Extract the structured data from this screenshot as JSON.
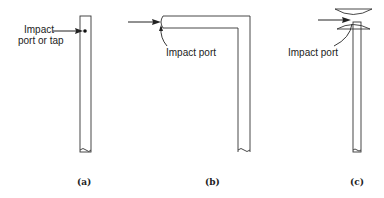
{
  "figure": {
    "panels": [
      {
        "id": "a",
        "caption": "(a)",
        "label_line1": "Impact",
        "label_line2": "port or tap",
        "description": "Straight tube with side impact port (tap)"
      },
      {
        "id": "b",
        "caption": "(b)",
        "label": "Impact port",
        "description": "L-shaped tube with open end facing flow"
      },
      {
        "id": "c",
        "caption": "(c)",
        "label": "Impact port",
        "description": "Straight tube with shielded impact port"
      }
    ],
    "colors": {
      "line": "#333333",
      "background": "#ffffff",
      "text": "#222222"
    }
  }
}
